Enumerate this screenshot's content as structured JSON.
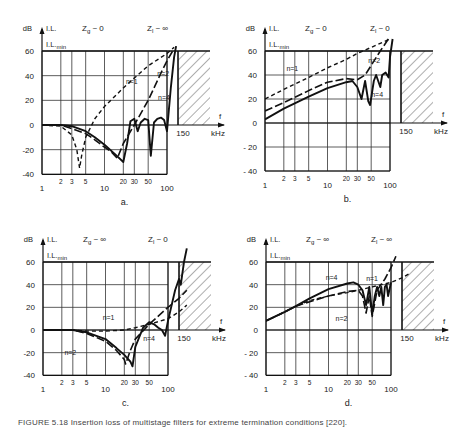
{
  "figure": {
    "caption": "FIGURE 5.18  Insertion loss of multistage filters for extreme termination conditions [220]."
  },
  "chart_data": [
    {
      "panel": "a.",
      "type": "line",
      "title": "",
      "ylabel": "dB",
      "y_series_label": "I.L.",
      "min_label": "I.L.",
      "min_sub": "min",
      "xlabel": "kHz",
      "x_axis_symbol": "f",
      "source_impedance": "Zg ~ 0",
      "load_impedance": "Zl ~ ∞",
      "xscale": "log",
      "xlim": [
        1,
        150
      ],
      "ylim": [
        -40,
        60
      ],
      "xticks": [
        1,
        2,
        3,
        5,
        10,
        20,
        30,
        50,
        100
      ],
      "yticks": [
        60,
        40,
        20,
        0,
        -20,
        -40
      ],
      "grid": true,
      "il_min_dB": 60,
      "forbidden_region_start_kHz": 150,
      "forbidden_region_label": "150",
      "series": [
        {
          "name": "n=1",
          "style": "dashed",
          "x": [
            1,
            2,
            3,
            3.6,
            4,
            4.3,
            5,
            7,
            10,
            20,
            30,
            50,
            100,
            130
          ],
          "y": [
            0,
            -1,
            -8,
            -20,
            -35,
            -25,
            -10,
            5,
            15,
            30,
            38,
            48,
            58,
            63
          ]
        },
        {
          "name": "n=2",
          "style": "long-dashed",
          "x": [
            1,
            2,
            3,
            5,
            7,
            10,
            13,
            16,
            20,
            30,
            50,
            80,
            100,
            130
          ],
          "y": [
            0,
            0,
            -3,
            -7,
            -12,
            -18,
            -22,
            -27,
            -15,
            0,
            20,
            42,
            52,
            62
          ]
        },
        {
          "name": "n=4",
          "style": "solid",
          "x": [
            1,
            2,
            3,
            5,
            7,
            10,
            15,
            20,
            23,
            26,
            30,
            34,
            38,
            44,
            50,
            55,
            62,
            70,
            80,
            90,
            100,
            115,
            130,
            140
          ],
          "y": [
            0,
            0,
            -1,
            -5,
            -10,
            -16,
            -24,
            -30,
            -15,
            3,
            5,
            -5,
            2,
            5,
            4,
            -25,
            2,
            5,
            6,
            4,
            -5,
            30,
            55,
            64
          ]
        }
      ],
      "annotations": [
        "n=1",
        "n=2",
        "n=4"
      ]
    },
    {
      "panel": "b.",
      "type": "line",
      "ylabel": "dB",
      "y_series_label": "I.L.",
      "min_label": "I.L.",
      "min_sub": "min",
      "xlabel": "kHz",
      "x_axis_symbol": "f",
      "source_impedance": "Zg ~ 0",
      "load_impedance": "Zl ~ 0",
      "xscale": "log",
      "xlim": [
        1,
        150
      ],
      "ylim": [
        -40,
        60
      ],
      "xticks": [
        1,
        2,
        3,
        5,
        10,
        20,
        30,
        50,
        100
      ],
      "yticks": [
        60,
        40,
        20,
        0,
        -20,
        -40
      ],
      "grid": true,
      "il_min_dB": 60,
      "forbidden_region_start_kHz": 150,
      "forbidden_region_label": "150",
      "series": [
        {
          "name": "n=1",
          "style": "dashed",
          "x": [
            1,
            2,
            5,
            10,
            20,
            30,
            50,
            100
          ],
          "y": [
            20,
            28,
            38,
            46,
            53,
            58,
            63,
            70
          ]
        },
        {
          "name": "n=2",
          "style": "long-dashed",
          "x": [
            1,
            2,
            5,
            10,
            20,
            30,
            40,
            50,
            70,
            100
          ],
          "y": [
            10,
            17,
            27,
            34,
            37,
            36,
            40,
            48,
            60,
            72
          ]
        },
        {
          "name": "n=4",
          "style": "solid",
          "x": [
            1,
            2,
            5,
            10,
            20,
            25,
            30,
            35,
            40,
            45,
            48,
            55,
            60,
            70,
            75,
            85,
            95,
            100,
            110
          ],
          "y": [
            3,
            12,
            22,
            29,
            34,
            35,
            30,
            20,
            35,
            18,
            15,
            35,
            40,
            30,
            40,
            42,
            38,
            55,
            70
          ]
        }
      ],
      "annotations": [
        "n=1",
        "n=2",
        "n=4"
      ]
    },
    {
      "panel": "c.",
      "type": "line",
      "ylabel": "dB",
      "y_series_label": "I.L.",
      "min_label": "I.L.",
      "min_sub": "min",
      "xlabel": "kHz",
      "x_axis_symbol": "f",
      "source_impedance": "Zg ~ ∞",
      "load_impedance": "Zl ~ 0",
      "xscale": "log",
      "xlim": [
        1,
        150
      ],
      "ylim": [
        -40,
        60
      ],
      "xticks": [
        1,
        2,
        3,
        5,
        10,
        20,
        30,
        50,
        100
      ],
      "yticks": [
        60,
        40,
        20,
        0,
        -20,
        -40
      ],
      "grid": true,
      "il_min_dB": 60,
      "forbidden_region_start_kHz": 150,
      "forbidden_region_label": "150",
      "series": [
        {
          "name": "n=1",
          "style": "dashed",
          "x": [
            1,
            3,
            5,
            10,
            20,
            30,
            50,
            100,
            150,
            200
          ],
          "y": [
            0,
            0,
            -1,
            -1,
            0,
            2,
            5,
            10,
            16,
            22
          ]
        },
        {
          "name": "n=2",
          "style": "long-dashed",
          "x": [
            1,
            3,
            5,
            10,
            15,
            20,
            21,
            25,
            30,
            50,
            100,
            150,
            200
          ],
          "y": [
            0,
            0,
            -3,
            -10,
            -18,
            -26,
            -30,
            -18,
            -8,
            5,
            20,
            28,
            35
          ]
        },
        {
          "name": "n=4",
          "style": "solid",
          "x": [
            1,
            3,
            5,
            10,
            15,
            20,
            25,
            27,
            30,
            40,
            50,
            60,
            70,
            80,
            90,
            100,
            130,
            150,
            160,
            180,
            200
          ],
          "y": [
            0,
            0,
            -2,
            -8,
            -16,
            -22,
            -28,
            -32,
            -15,
            2,
            7,
            5,
            2,
            0,
            -5,
            8,
            35,
            45,
            40,
            60,
            72
          ]
        }
      ],
      "annotations": [
        "n=1",
        "n=2",
        "n=4"
      ]
    },
    {
      "panel": "d.",
      "type": "line",
      "ylabel": "dB",
      "y_series_label": "I.L.",
      "min_label": "I.L.",
      "min_sub": "min",
      "xlabel": "kHz",
      "x_axis_symbol": "f",
      "source_impedance": "Zg ~ ∞",
      "load_impedance": "Zl ~ ∞",
      "xscale": "log",
      "xlim": [
        1,
        150
      ],
      "ylim": [
        -40,
        60
      ],
      "xticks": [
        1,
        2,
        3,
        5,
        10,
        20,
        30,
        50,
        100
      ],
      "yticks": [
        60,
        40,
        20,
        0,
        -20,
        -40
      ],
      "grid": true,
      "il_min_dB": 60,
      "forbidden_region_start_kHz": 150,
      "forbidden_region_label": "150",
      "series": [
        {
          "name": "n=1",
          "style": "dashed",
          "x": [
            1,
            2,
            3,
            5,
            10,
            20,
            30,
            50,
            100,
            150,
            200
          ],
          "y": [
            8,
            16,
            21,
            26,
            30,
            33,
            35,
            38,
            42,
            46,
            50
          ]
        },
        {
          "name": "n=2",
          "style": "long-dashed",
          "x": [
            1,
            2,
            3,
            5,
            10,
            20,
            30,
            35,
            40,
            45,
            50,
            60,
            80,
            100,
            120
          ],
          "y": [
            8,
            16,
            21,
            25,
            30,
            34,
            35,
            30,
            15,
            30,
            12,
            35,
            45,
            55,
            65
          ]
        },
        {
          "name": "n=4",
          "style": "solid",
          "x": [
            1,
            2,
            3,
            5,
            10,
            20,
            25,
            30,
            35,
            40,
            45,
            50,
            55,
            60,
            65,
            70,
            75,
            80,
            85,
            90,
            100
          ],
          "y": [
            8,
            16,
            21,
            28,
            36,
            41,
            42,
            40,
            35,
            22,
            38,
            14,
            30,
            38,
            30,
            38,
            22,
            38,
            40,
            30,
            42
          ]
        }
      ],
      "annotations": [
        "n=4",
        "n=1",
        "n=2"
      ]
    }
  ]
}
